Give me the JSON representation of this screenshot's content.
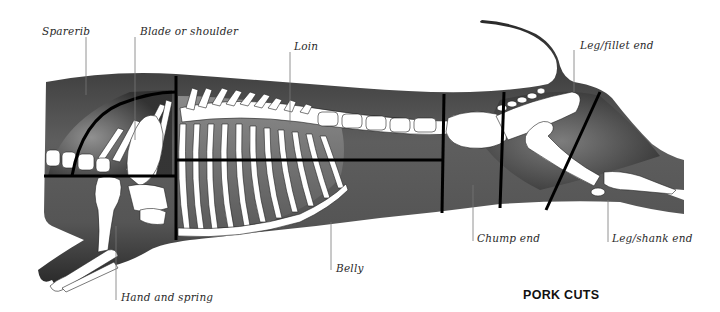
{
  "title": "PORK CUTS",
  "colors": {
    "body_dark": "#2b2b2b",
    "body_mid": "#6a6a6a",
    "ribcage_band": "#7d7d7d",
    "bone": "#ffffff",
    "cut_line": "#000000",
    "leader_line": "#777777",
    "label_text": "#2a2a2a"
  },
  "labels": [
    {
      "id": "sparerib",
      "text": "Sparerib"
    },
    {
      "id": "blade",
      "text": "Blade or shoulder"
    },
    {
      "id": "loin",
      "text": "Loin"
    },
    {
      "id": "leg-fillet",
      "text": "Leg/fillet end"
    },
    {
      "id": "chump",
      "text": "Chump end"
    },
    {
      "id": "leg-shank",
      "text": "Leg/shank end"
    },
    {
      "id": "belly",
      "text": "Belly"
    },
    {
      "id": "hand",
      "text": "Hand and spring"
    }
  ],
  "cuts": [
    "Sparerib",
    "Blade or shoulder",
    "Loin",
    "Chump end",
    "Leg/fillet end",
    "Leg/shank end",
    "Belly",
    "Hand and spring"
  ]
}
